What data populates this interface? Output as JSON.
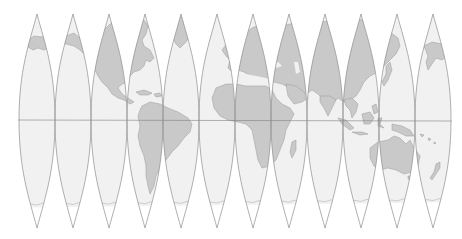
{
  "map": {
    "type": "interrupted globe gores",
    "gore_count": 12,
    "gore_width_deg": 30,
    "colors": {
      "ocean": "#f1f1f1",
      "land": "#c9c9c9",
      "outline": "#8e8e8e",
      "polar_cap": "#ffffff",
      "background": "#ffffff"
    },
    "features": {
      "equator": "horizontal line across all gores",
      "regions_left_to_right": [
        "Alaska / North Pacific",
        "Western Canada",
        "North America / Mexico",
        "Eastern North America / Caribbean / South America",
        "Greenland / Atlantic / South America",
        "Western Europe / West Africa",
        "Europe / Mediterranean / Africa",
        "Middle East / East Africa / Madagascar",
        "Central Asia / India",
        "East Asia / Southeast Asia / Indonesia",
        "Japan / Australia / Melanesia",
        "Eastern Siberia / New Zealand / Pacific"
      ]
    }
  }
}
